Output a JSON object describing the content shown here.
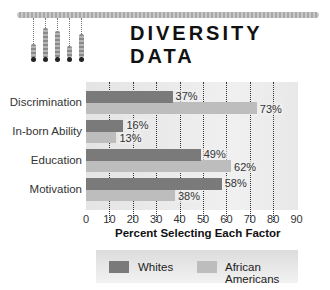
{
  "header": {
    "title": "DIVERSITY DATA",
    "logo_icon": "bar-graph-logo-icon"
  },
  "colors": {
    "whites": "#7a7a7a",
    "african_americans": "#bdbdbd",
    "plot_bg": "#e8e8e8"
  },
  "chart_data": {
    "type": "bar",
    "orientation": "horizontal",
    "title": "DIVERSITY DATA",
    "xlabel": "Percent Selecting Each Factor",
    "ylabel": "",
    "categories": [
      "Discrimination",
      "In-born Ability",
      "Education",
      "Motivation"
    ],
    "series": [
      {
        "name": "Whites",
        "values": [
          37,
          16,
          49,
          58
        ],
        "labels": [
          "37%",
          "16%",
          "49%",
          "58%"
        ]
      },
      {
        "name": "African Americans",
        "values": [
          73,
          13,
          62,
          38
        ],
        "labels": [
          "73%",
          "13%",
          "62%",
          "38%"
        ]
      }
    ],
    "xlim": [
      0,
      90
    ],
    "x_ticks": [
      "0",
      "10",
      "20",
      "30",
      "40",
      "50",
      "60",
      "70",
      "80",
      "90"
    ],
    "grid": "vertical dotted",
    "legend_position": "bottom"
  },
  "legend": {
    "items": [
      {
        "label": "Whites"
      },
      {
        "label": "African Americans"
      }
    ]
  }
}
